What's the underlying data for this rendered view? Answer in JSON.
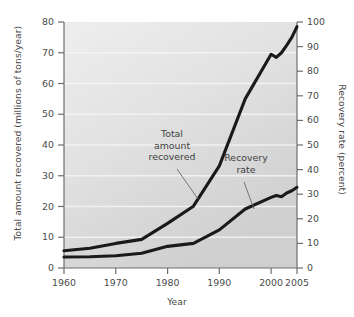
{
  "chart_data": {
    "type": "line",
    "title": "",
    "xlabel": "Year",
    "ylabel": "Total amount recovered (millions of tons/year)",
    "ylabel_right": "Recovery rate (percent)",
    "xlim": [
      1960,
      2005
    ],
    "ylim": [
      0,
      80
    ],
    "ylim_right": [
      0,
      100
    ],
    "grid": "horizontal-white-faint",
    "legend": "none (inline annotations)",
    "xticks": [
      1960,
      1970,
      1980,
      1990,
      2000,
      2005
    ],
    "xtick_labels": [
      "1960",
      "1970",
      "1980",
      "1990",
      "2000",
      "2005"
    ],
    "yticks_left": [
      0,
      10,
      20,
      30,
      40,
      50,
      60,
      70,
      80
    ],
    "ytick_labels_left": [
      "0",
      "10",
      "20",
      "30",
      "40",
      "50",
      "60",
      "70",
      "80"
    ],
    "yticks_right": [
      0,
      10,
      20,
      30,
      40,
      50,
      60,
      70,
      80,
      90,
      100
    ],
    "ytick_labels_right": [
      "0",
      "10",
      "20",
      "30",
      "40",
      "50",
      "60",
      "70",
      "80",
      "90",
      "100"
    ],
    "series": [
      {
        "name": "Total amount recovered",
        "axis": "left",
        "units": "millions of tons/year",
        "x": [
          1960,
          1965,
          1970,
          1975,
          1980,
          1985,
          1990,
          1995,
          2000,
          2001,
          2002,
          2003,
          2004,
          2005
        ],
        "values": [
          5.6,
          6.4,
          8.0,
          9.3,
          14.5,
          20.1,
          33.2,
          55.0,
          69.5,
          68.5,
          70.0,
          72.4,
          75.0,
          78.5
        ]
      },
      {
        "name": "Recovery rate",
        "axis": "right",
        "units": "percent",
        "x": [
          1960,
          1965,
          1970,
          1975,
          1980,
          1985,
          1990,
          1995,
          2000,
          2001,
          2002,
          2003,
          2004,
          2005
        ],
        "values": [
          4.5,
          4.6,
          5.0,
          6.0,
          8.8,
          10.0,
          15.5,
          24.0,
          28.7,
          29.5,
          29.0,
          30.5,
          31.4,
          32.8
        ]
      }
    ],
    "annotations": [
      {
        "name": "total-amount-recovered",
        "lines": [
          "Total",
          "amount",
          "recovered"
        ],
        "label_x": 172,
        "label_y": 135,
        "leader_from_x": 177,
        "leader_from_y": 169,
        "leader_to_x": 198,
        "leader_to_y": 199
      },
      {
        "name": "recovery-rate",
        "lines": [
          "Recovery",
          "rate"
        ],
        "label_x": 232,
        "label_y": 160,
        "leader_from_x": 244,
        "leader_from_y": 182,
        "leader_to_x": 254,
        "leader_to_y": 209
      }
    ],
    "colors": {
      "line": "#1a1a1a",
      "plot_background_light": "#ebebeb",
      "plot_background_dark": "#cfcfcf",
      "gridline": "#f7f7f7",
      "axis": "#6e6e6e",
      "text": "#4a4a4a",
      "page_background": "#ffffff"
    }
  }
}
